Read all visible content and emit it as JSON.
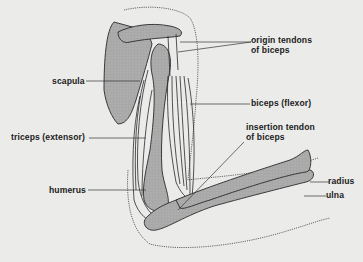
{
  "diagram": {
    "colors": {
      "background": "#ebebea",
      "bone_fill": "#a9a9a9",
      "outline": "#2a2a2a",
      "label_text": "#1c1c1c"
    },
    "labels": {
      "origin_tendons_line1": "origin tendons",
      "origin_tendons_line2": "of biceps",
      "scapula": "scapula",
      "biceps": "biceps (flexor)",
      "insertion_tendon_line1": "insertion tendon",
      "insertion_tendon_line2": "of biceps",
      "triceps": "triceps (extensor)",
      "humerus": "humerus",
      "radius": "radius",
      "ulna": "ulna"
    }
  }
}
